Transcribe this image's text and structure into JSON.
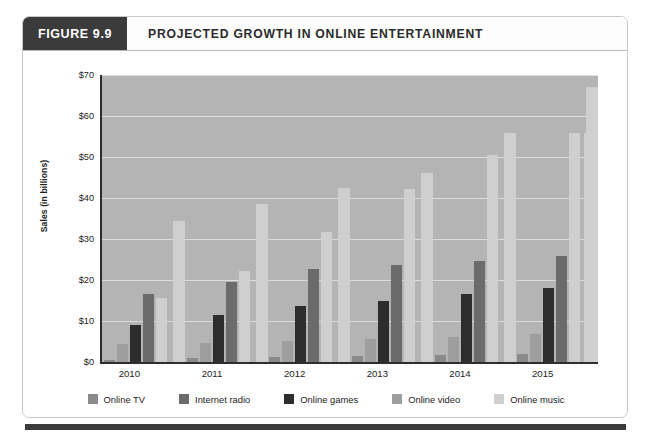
{
  "figure": {
    "number_label": "FIGURE 9.9",
    "title": "PROJECTED GROWTH IN ONLINE ENTERTAINMENT"
  },
  "chart_data": {
    "type": "bar",
    "title": "PROJECTED GROWTH IN ONLINE ENTERTAINMENT",
    "xlabel": "",
    "ylabel": "Sales (in billions)",
    "ylim": [
      0,
      70
    ],
    "ytick_labels": [
      "$0",
      "$10",
      "$20",
      "$30",
      "$40",
      "$50",
      "$60",
      "$70"
    ],
    "ytick_values": [
      0,
      10,
      20,
      30,
      40,
      50,
      60,
      70
    ],
    "grid": true,
    "legend_position": "bottom",
    "categories": [
      "2010",
      "2011",
      "2012",
      "2013",
      "2014",
      "2015"
    ],
    "series": [
      {
        "name": "Online TV",
        "color": "#8a8a8a",
        "values": [
          0.5,
          1.0,
          1.2,
          1.5,
          1.8,
          2.0
        ]
      },
      {
        "name": "Internet radio",
        "color": "#6b6b6b",
        "values": [
          16.5,
          19.6,
          22.7,
          23.7,
          24.6,
          25.8
        ]
      },
      {
        "name": "Online games",
        "color": "#2d2d2d",
        "values": [
          9.0,
          11.5,
          13.6,
          15.0,
          16.5,
          18.0
        ]
      },
      {
        "name": "Online video",
        "color": "#9e9e9e",
        "values": [
          4.3,
          4.6,
          5.1,
          5.6,
          6.0,
          6.8
        ]
      },
      {
        "name": "Online music",
        "color": "#cfcfcf",
        "values": [
          15.5,
          22.2,
          31.7,
          42.2,
          50.5,
          55.8
        ]
      }
    ],
    "series_display_order": [
      "Online TV",
      "Online video",
      "Online games",
      "Internet radio",
      "Online music"
    ],
    "bars_by_group": [
      {
        "category": "2010",
        "bars": [
          {
            "series": "Online TV",
            "value": 0.5
          },
          {
            "series": "Online video",
            "value": 4.3
          },
          {
            "series": "Online games",
            "value": 9.0
          },
          {
            "series": "Internet radio",
            "value": 16.5
          },
          {
            "series": "Online music",
            "value": 15.5
          }
        ]
      },
      {
        "category": "2011",
        "bars": [
          {
            "series": "Online TV",
            "value": 1.0
          },
          {
            "series": "Online video",
            "value": 4.6
          },
          {
            "series": "Online games",
            "value": 11.5
          },
          {
            "series": "Internet radio",
            "value": 19.6
          },
          {
            "series": "Online music",
            "value": 22.2
          }
        ]
      },
      {
        "category": "2012",
        "bars": [
          {
            "series": "Online TV",
            "value": 1.2
          },
          {
            "series": "Online video",
            "value": 5.1
          },
          {
            "series": "Online games",
            "value": 13.6
          },
          {
            "series": "Internet radio",
            "value": 22.7
          },
          {
            "series": "Online music",
            "value": 31.7
          }
        ]
      },
      {
        "category": "2013",
        "bars": [
          {
            "series": "Online TV",
            "value": 1.5
          },
          {
            "series": "Online video",
            "value": 5.6
          },
          {
            "series": "Online games",
            "value": 15.0
          },
          {
            "series": "Internet radio",
            "value": 23.7
          },
          {
            "series": "Online music",
            "value": 42.2
          }
        ]
      },
      {
        "category": "2014",
        "bars": [
          {
            "series": "Online TV",
            "value": 1.8
          },
          {
            "series": "Online video",
            "value": 6.0
          },
          {
            "series": "Online games",
            "value": 16.5
          },
          {
            "series": "Internet radio",
            "value": 24.6
          },
          {
            "series": "Online music",
            "value": 50.5
          }
        ]
      },
      {
        "category": "2015",
        "bars": [
          {
            "series": "Online TV",
            "value": 2.0
          },
          {
            "series": "Online video",
            "value": 6.8
          },
          {
            "series": "Online games",
            "value": 18.0
          },
          {
            "series": "Internet radio",
            "value": 25.8
          },
          {
            "series": "Online music",
            "value": 55.8
          }
        ]
      }
    ],
    "extra_bars": [
      {
        "series": "Online music",
        "value": 34.5,
        "after_category": "2010",
        "note": "tall light bar between 2010 and 2011 groups"
      },
      {
        "series": "Online music",
        "value": 38.5,
        "after_category": "2011"
      },
      {
        "series": "Online music",
        "value": 42.5,
        "after_category": "2012"
      },
      {
        "series": "Online music",
        "value": 46.0,
        "after_category": "2013"
      },
      {
        "series": "Online music",
        "value": 55.8,
        "after_category": "2014"
      },
      {
        "series": "Online music",
        "value": 67.0,
        "after_category": "2015"
      },
      {
        "series": "Online music",
        "value": 55.8,
        "after_category": "2015-trailing"
      }
    ]
  },
  "legend": {
    "items": [
      {
        "label": "Online TV",
        "color": "#8a8a8a"
      },
      {
        "label": "Internet radio",
        "color": "#6b6b6b"
      },
      {
        "label": "Online games",
        "color": "#2d2d2d"
      },
      {
        "label": "Online video",
        "color": "#9e9e9e"
      },
      {
        "label": "Online music",
        "color": "#cfcfcf"
      }
    ]
  },
  "colors": {
    "header_block": "#3b3b3b",
    "plot_background": "#b4b4b4",
    "gridline": "#dcdcdc",
    "axis": "#2e2e2e"
  }
}
